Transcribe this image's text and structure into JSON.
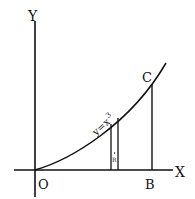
{
  "diagram": {
    "axes": {
      "x_label": "X",
      "y_label": "Y",
      "origin_label": "O"
    },
    "curve": {
      "equation_base": "y=x",
      "equation_exp": "3"
    },
    "points": {
      "B": "B",
      "C": "C"
    },
    "strip_label": "R",
    "colors": {
      "ink": "#111111",
      "background": "#ffffff"
    }
  }
}
